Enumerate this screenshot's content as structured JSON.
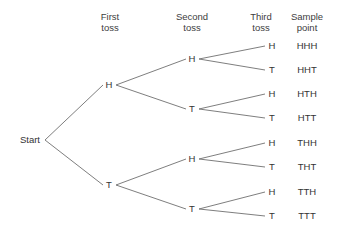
{
  "diagram": {
    "start_label": "Start",
    "line_color": "#6f6f6f",
    "text_color": "#333333",
    "background_color": "#ffffff",
    "columns": [
      {
        "line1": "First",
        "line2": "toss"
      },
      {
        "line1": "Second",
        "line2": "toss"
      },
      {
        "line1": "Third",
        "line2": "toss"
      },
      {
        "line1": "Sample",
        "line2": "point"
      }
    ],
    "level1": [
      {
        "label": "H"
      },
      {
        "label": "T"
      }
    ],
    "level2": [
      {
        "label": "H"
      },
      {
        "label": "T"
      },
      {
        "label": "H"
      },
      {
        "label": "T"
      }
    ],
    "level3": [
      {
        "label": "H"
      },
      {
        "label": "T"
      },
      {
        "label": "H"
      },
      {
        "label": "T"
      },
      {
        "label": "H"
      },
      {
        "label": "T"
      },
      {
        "label": "H"
      },
      {
        "label": "T"
      }
    ],
    "sample_points": [
      {
        "label": "HHH"
      },
      {
        "label": "HHT"
      },
      {
        "label": "HTH"
      },
      {
        "label": "HTT"
      },
      {
        "label": "THH"
      },
      {
        "label": "THT"
      },
      {
        "label": "TTH"
      },
      {
        "label": "TTT"
      }
    ]
  }
}
